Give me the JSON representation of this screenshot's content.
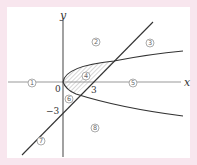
{
  "diagram": {
    "axes": {
      "x_label": "x",
      "y_label": "y",
      "origin_label": "0"
    },
    "tick_labels": {
      "x_intercept": "3",
      "y_intercept": "−3"
    },
    "regions": [
      {
        "id": "1",
        "label": "①"
      },
      {
        "id": "2",
        "label": "②"
      },
      {
        "id": "3",
        "label": "③"
      },
      {
        "id": "4",
        "label": "④"
      },
      {
        "id": "5",
        "label": "⑤"
      },
      {
        "id": "6",
        "label": "⑥"
      },
      {
        "id": "7",
        "label": "⑦"
      },
      {
        "id": "8",
        "label": "⑧"
      }
    ],
    "curves": {
      "line": "line through (3,0) and (0,−3)",
      "parabola": "sideways parabola opening right, vertex at origin"
    },
    "shaded_region": "4",
    "colors": {
      "background": "#f8e6ee",
      "frame": "#ffffff",
      "stroke": "#333333",
      "axis": "#999999"
    }
  }
}
